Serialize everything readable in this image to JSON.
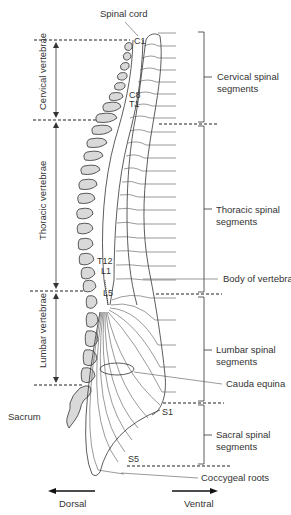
{
  "diagram": {
    "top_label": "Spinal cord",
    "left_labels": {
      "cervical": "Cervical vertebrae",
      "thoracic": "Thoracic vertebrae",
      "lumbar": "Lumbar vertebrae",
      "sacrum": "Sacrum"
    },
    "segment_markers": {
      "c1": "C1",
      "c8": "C8",
      "t1": "T1",
      "t12": "T12",
      "l1": "L1",
      "l5": "L5",
      "s1": "S1",
      "s5": "S5"
    },
    "right_labels": {
      "cervical_line1": "Cervical spinal",
      "cervical_line2": "segments",
      "thoracic_line1": "Thoracic spinal",
      "thoracic_line2": "segments",
      "body": "Body of vertebra",
      "lumbar_line1": "Lumbar spinal",
      "lumbar_line2": "segments",
      "cauda": "Cauda equina",
      "sacral_line1": "Sacral spinal",
      "sacral_line2": "segments",
      "coccygeal": "Coccygeal roots"
    },
    "directions": {
      "dorsal": "Dorsal",
      "ventral": "Ventral"
    }
  }
}
